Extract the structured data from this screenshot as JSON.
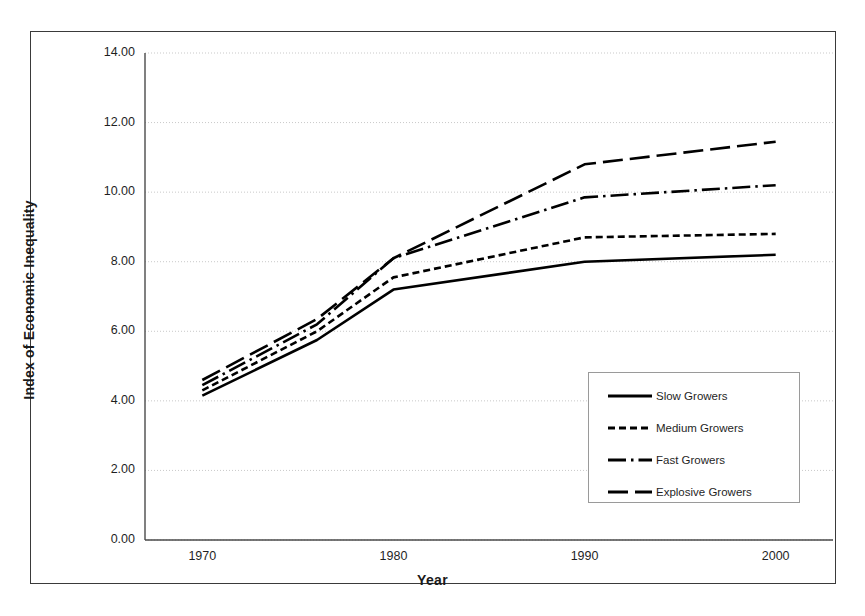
{
  "chart_data": {
    "type": "line",
    "title": "",
    "xlabel": "Year",
    "ylabel": "Index of Economic Inequality",
    "x": [
      1970,
      1976,
      1980,
      1990,
      2000
    ],
    "xlim": [
      1967,
      2003
    ],
    "ylim": [
      0.0,
      14.0
    ],
    "ytick_labels": [
      "0.00",
      "2.00",
      "4.00",
      "6.00",
      "8.00",
      "10.00",
      "12.00",
      "14.00"
    ],
    "ytick_values": [
      0,
      2,
      4,
      6,
      8,
      10,
      12,
      14
    ],
    "xtick_labels": [
      "1970",
      "1980",
      "1990",
      "2000"
    ],
    "xtick_values": [
      1970,
      1980,
      1990,
      2000
    ],
    "grid": "horizontal",
    "legend_position": "inside-lower-right",
    "series": [
      {
        "name": "Slow Growers",
        "style": "solid",
        "values": [
          4.15,
          5.75,
          7.2,
          8.0,
          8.2
        ]
      },
      {
        "name": "Medium Growers",
        "style": "dashed",
        "values": [
          4.3,
          6.0,
          7.55,
          8.7,
          8.8
        ]
      },
      {
        "name": "Fast Growers",
        "style": "dash-dot",
        "values": [
          4.45,
          6.2,
          8.1,
          9.85,
          10.2
        ]
      },
      {
        "name": "Explosive Growers",
        "style": "long-dash",
        "values": [
          4.6,
          6.35,
          8.1,
          10.8,
          11.45
        ]
      }
    ]
  },
  "axis": {
    "y_title": "Index of Economic Inequality",
    "x_title": "Year",
    "y_ticks": [
      "14.00",
      "12.00",
      "10.00",
      "8.00",
      "6.00",
      "4.00",
      "2.00",
      "0.00"
    ],
    "x_ticks": [
      "1970",
      "1980",
      "1990",
      "2000"
    ]
  },
  "legend": {
    "items": [
      {
        "label": "Slow Growers",
        "style": "solid"
      },
      {
        "label": "Medium Growers",
        "style": "dashed"
      },
      {
        "label": "Fast Growers",
        "style": "dash-dot"
      },
      {
        "label": "Explosive Growers",
        "style": "long-dash"
      }
    ]
  },
  "colors": {
    "line": "#000000",
    "grid": "#c9c9c9",
    "axis": "#4a4a4a",
    "frame": "#3a3a3a",
    "legend_border": "#9a9a9a",
    "background": "#ffffff"
  }
}
